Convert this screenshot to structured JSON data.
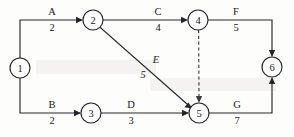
{
  "diagram": {
    "type": "activity-on-arrow-network",
    "title": "",
    "background_color": "#fdfdfc",
    "line_color": "#24262b",
    "nodes": [
      {
        "id": "1",
        "label": "1",
        "cx": 20,
        "cy": 68,
        "r": 10
      },
      {
        "id": "2",
        "label": "2",
        "cx": 93,
        "cy": 20,
        "r": 10
      },
      {
        "id": "3",
        "label": "3",
        "cx": 91,
        "cy": 113,
        "r": 10
      },
      {
        "id": "4",
        "label": "4",
        "cx": 198,
        "cy": 20,
        "r": 10
      },
      {
        "id": "5",
        "label": "5",
        "cx": 199,
        "cy": 113,
        "r": 10
      },
      {
        "id": "6",
        "label": "6",
        "cx": 272,
        "cy": 67,
        "r": 10
      }
    ],
    "edges": [
      {
        "id": "A",
        "from": "1",
        "to": "2",
        "name": "A",
        "value": "2",
        "style": "solid",
        "name_x": 52,
        "name_y": 15,
        "value_x": 52,
        "value_y": 31,
        "italic": false
      },
      {
        "id": "B",
        "from": "1",
        "to": "3",
        "name": "B",
        "value": "2",
        "style": "solid",
        "name_x": 52,
        "name_y": 108,
        "value_x": 52,
        "value_y": 124,
        "italic": false
      },
      {
        "id": "C",
        "from": "2",
        "to": "4",
        "name": "C",
        "value": "4",
        "style": "solid",
        "name_x": 158,
        "name_y": 15,
        "value_x": 158,
        "value_y": 31,
        "italic": false
      },
      {
        "id": "D",
        "from": "3",
        "to": "5",
        "name": "D",
        "value": "3",
        "style": "solid",
        "name_x": 131,
        "name_y": 108,
        "value_x": 131,
        "value_y": 124,
        "italic": false
      },
      {
        "id": "E",
        "from": "2",
        "to": "5",
        "name": "E",
        "value": "5",
        "style": "solid",
        "name_x": 156,
        "name_y": 63,
        "value_x": 143,
        "value_y": 78,
        "italic": true
      },
      {
        "id": "F",
        "from": "4",
        "to": "6",
        "name": "F",
        "value": "5",
        "style": "solid",
        "name_x": 236,
        "name_y": 15,
        "value_x": 236,
        "value_y": 31,
        "italic": false
      },
      {
        "id": "G",
        "from": "5",
        "to": "6",
        "name": "G",
        "value": "7",
        "style": "solid",
        "name_x": 237,
        "name_y": 108,
        "value_x": 237,
        "value_y": 124,
        "italic": false
      },
      {
        "id": "dummy",
        "from": "4",
        "to": "5",
        "name": "",
        "value": "",
        "style": "dashed",
        "name_x": 0,
        "name_y": 0,
        "value_x": 0,
        "value_y": 0,
        "italic": false
      }
    ]
  }
}
